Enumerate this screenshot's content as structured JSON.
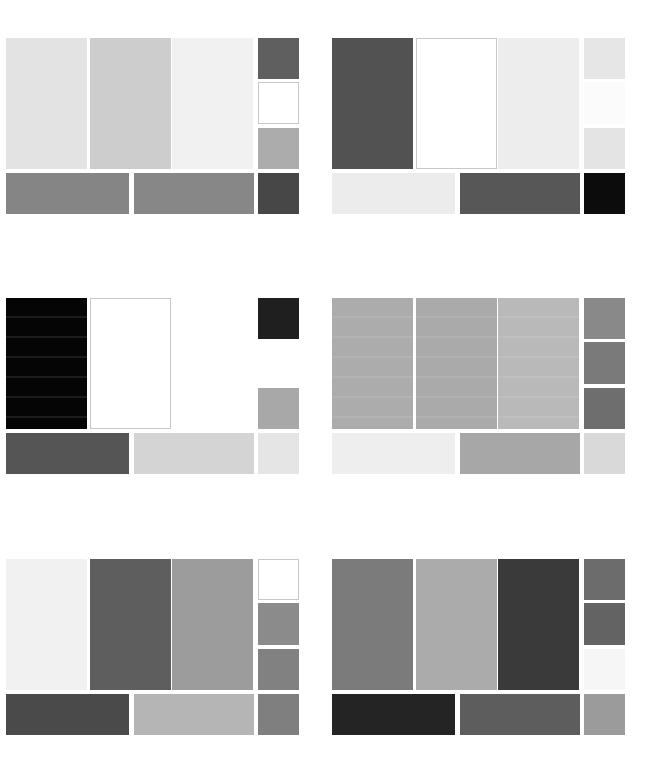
{
  "layout": {
    "panel_origins": [
      [
        6,
        38
      ],
      [
        332,
        38
      ],
      [
        6,
        298
      ],
      [
        332,
        298
      ],
      [
        6,
        559
      ],
      [
        332,
        559
      ]
    ],
    "cells": [
      {
        "id": "tall-1",
        "x": 0,
        "y": 0,
        "w": 81,
        "h": 131
      },
      {
        "id": "tall-2",
        "x": 84,
        "y": 0,
        "w": 81,
        "h": 131
      },
      {
        "id": "tall-3",
        "x": 166,
        "y": 0,
        "w": 81,
        "h": 131
      },
      {
        "id": "small-1",
        "x": 252,
        "y": 0,
        "w": 41,
        "h": 41
      },
      {
        "id": "small-2",
        "x": 252,
        "y": 44,
        "w": 41,
        "h": 42
      },
      {
        "id": "small-3",
        "x": 252,
        "y": 90,
        "w": 41,
        "h": 41
      },
      {
        "id": "wide-1",
        "x": 0,
        "y": 135,
        "w": 123,
        "h": 41
      },
      {
        "id": "wide-2",
        "x": 128,
        "y": 135,
        "w": 120,
        "h": 41
      },
      {
        "id": "small-4",
        "x": 252,
        "y": 135,
        "w": 41,
        "h": 41
      }
    ]
  },
  "panels": [
    {
      "name": "panel-1",
      "swatches": [
        {
          "color": "#e3e3e3"
        },
        {
          "color": "#cdcdcd"
        },
        {
          "color": "#f1f1f1"
        },
        {
          "color": "#5f5f5f"
        },
        {
          "color": "#ffffff",
          "outlined": true
        },
        {
          "color": "#acacac"
        },
        {
          "color": "#858585"
        },
        {
          "color": "#878787"
        },
        {
          "color": "#474747"
        }
      ]
    },
    {
      "name": "panel-2",
      "swatches": [
        {
          "color": "#525252"
        },
        {
          "color": "#ffffff",
          "outlined": true
        },
        {
          "color": "#ededed"
        },
        {
          "color": "#e6e6e6"
        },
        {
          "color": "#fbfbfb"
        },
        {
          "color": "#e4e4e4"
        },
        {
          "color": "#ececec"
        },
        {
          "color": "#575757"
        },
        {
          "color": "#0c0c0c"
        }
      ]
    },
    {
      "name": "panel-3",
      "swatches": [
        {
          "color": "#050505",
          "streaks": true
        },
        {
          "color": "#ffffff",
          "outlined": true
        },
        {
          "color": "#ffffff"
        },
        {
          "color": "#1f1f1f"
        },
        {
          "color": "#ffffff"
        },
        {
          "color": "#a8a8a8"
        },
        {
          "color": "#555555"
        },
        {
          "color": "#d4d4d4"
        },
        {
          "color": "#e5e5e5"
        }
      ]
    },
    {
      "name": "panel-4",
      "swatches": [
        {
          "color": "#acacac",
          "streaks": true
        },
        {
          "color": "#aaaaaa",
          "streaks": true
        },
        {
          "color": "#b9b9b9",
          "streaks": true
        },
        {
          "color": "#898989"
        },
        {
          "color": "#7a7a7a"
        },
        {
          "color": "#6e6e6e"
        },
        {
          "color": "#eeeeee"
        },
        {
          "color": "#a7a7a7"
        },
        {
          "color": "#d9d9d9"
        }
      ]
    },
    {
      "name": "panel-5",
      "swatches": [
        {
          "color": "#f1f1f1"
        },
        {
          "color": "#5e5e5e"
        },
        {
          "color": "#9c9c9c"
        },
        {
          "color": "#ffffff",
          "outlined": true
        },
        {
          "color": "#8b8b8b"
        },
        {
          "color": "#818181"
        },
        {
          "color": "#4a4a4a"
        },
        {
          "color": "#b5b5b5"
        },
        {
          "color": "#7f7f7f"
        }
      ]
    },
    {
      "name": "panel-6",
      "swatches": [
        {
          "color": "#7b7b7b"
        },
        {
          "color": "#ababab"
        },
        {
          "color": "#3a3a3a"
        },
        {
          "color": "#6c6c6c"
        },
        {
          "color": "#636363"
        },
        {
          "color": "#f6f6f6"
        },
        {
          "color": "#242424"
        },
        {
          "color": "#5d5d5d"
        },
        {
          "color": "#9b9b9b"
        }
      ]
    }
  ]
}
